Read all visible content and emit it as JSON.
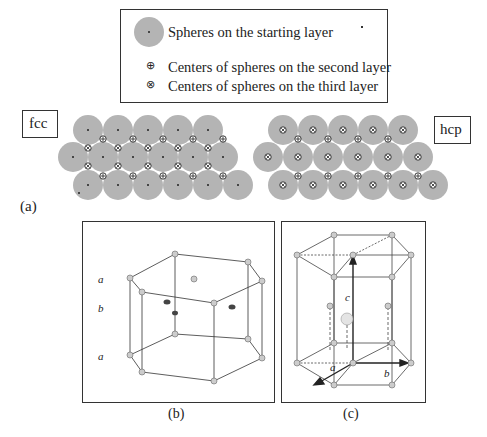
{
  "legend": {
    "items": [
      {
        "symbol": "grey-sphere-dot",
        "label": "Spheres on the starting layer"
      },
      {
        "symbol": "circle-plus",
        "label": "Centers of spheres on the second layer"
      },
      {
        "symbol": "circle-cross",
        "label": "Centers of spheres on the third layer"
      }
    ]
  },
  "panel_a": {
    "label": "(a)",
    "fcc_label": "fcc",
    "hcp_label": "hcp"
  },
  "panel_b": {
    "label": "(b)",
    "layer_labels": [
      "a",
      "b",
      "a"
    ]
  },
  "panel_c": {
    "label": "(c)",
    "axis_labels": {
      "a": "a",
      "b": "b",
      "c": "c"
    }
  },
  "colors": {
    "sphere": "#b4b4b4",
    "line": "#333333",
    "background": "#ffffff"
  }
}
